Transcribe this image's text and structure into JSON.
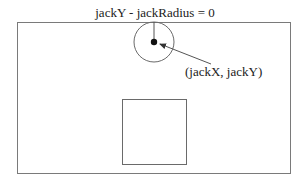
{
  "diagram": {
    "top_label": "jackY - jackRadius = 0",
    "center_label": "(jackX, jackY)",
    "elements": {
      "outer_frame": "canvas boundary",
      "jack": "circle with center point",
      "radius_line": "vertical radius from center to top edge",
      "pointer_arrow": "arrow from label to center point",
      "box": "square"
    },
    "colors": {
      "stroke": "#7a7a7a",
      "dot": "#111111",
      "text": "#222222",
      "background": "#ffffff"
    }
  }
}
